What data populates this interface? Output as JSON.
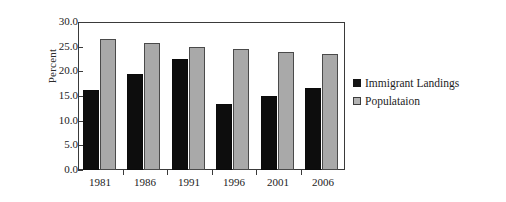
{
  "chart_data": {
    "type": "bar",
    "title": "",
    "xlabel": "",
    "ylabel": "Percent",
    "categories": [
      "1981",
      "1986",
      "1991",
      "1996",
      "2001",
      "2006"
    ],
    "series": [
      {
        "name": "Immigrant Landings",
        "color": "#0d0d0d",
        "values": [
          16.3,
          19.5,
          22.4,
          13.3,
          15.0,
          16.7
        ]
      },
      {
        "name": "Populataion",
        "color": "#a9a9a9",
        "values": [
          26.5,
          25.8,
          25.0,
          24.6,
          24.0,
          23.6
        ]
      }
    ],
    "ylim": [
      0.0,
      30.0
    ],
    "ytick_step": 5.0,
    "ytick_labels": [
      "30.0",
      "25.0",
      "20.0",
      "15.0",
      "10.0",
      "5.0",
      "0.0"
    ],
    "ytick_values": [
      30.0,
      25.0,
      20.0,
      15.0,
      10.0,
      5.0,
      0.0
    ],
    "grid": false,
    "legend_position": "right",
    "frame": true
  },
  "legend": {
    "entries": [
      {
        "label": "Immigrant Landings",
        "swatch": "immigrant"
      },
      {
        "label": "Populataion",
        "swatch": "population"
      }
    ]
  },
  "axis": {
    "y_title": "Percent"
  }
}
